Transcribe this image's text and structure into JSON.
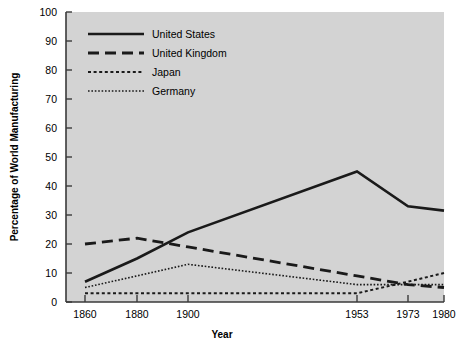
{
  "chart_data": {
    "type": "line",
    "title": "",
    "xlabel": "Year",
    "ylabel": "Percentage of World Manufacturing",
    "x": [
      1860,
      1880,
      1900,
      1953,
      1973,
      1980
    ],
    "xticklabels": [
      "1860",
      "1880",
      "1900",
      "1953",
      "1973",
      "1980"
    ],
    "yticklabels": [
      "0",
      "10",
      "20",
      "30",
      "40",
      "50",
      "60",
      "70",
      "80",
      "90",
      "100"
    ],
    "ylim": [
      0,
      100
    ],
    "ytick_step": 10,
    "grid": false,
    "legend_position": "top-left-inside",
    "plot_background": "#d3d3d3",
    "line_color": "#1a1a1a",
    "series": [
      {
        "name": "United States",
        "style": "solid",
        "values": [
          7,
          15,
          24,
          45,
          33,
          31.5
        ]
      },
      {
        "name": "United Kingdom",
        "style": "dashed",
        "values": [
          20,
          22,
          19,
          9,
          6,
          5
        ]
      },
      {
        "name": "Japan",
        "style": "dotted",
        "values": [
          3,
          3,
          3,
          3,
          7,
          10
        ]
      },
      {
        "name": "Germany",
        "style": "fine-dotted",
        "values": [
          5,
          9,
          13,
          6,
          6,
          6
        ]
      }
    ]
  },
  "legend": {
    "entries": [
      {
        "label": "United States",
        "style": "solid"
      },
      {
        "label": "United Kingdom",
        "style": "dashed"
      },
      {
        "label": "Japan",
        "style": "dotted"
      },
      {
        "label": "Germany",
        "style": "fine-dotted"
      }
    ]
  },
  "axes": {
    "y_title": "Percentage of World Manufacturing",
    "x_title": "Year"
  }
}
